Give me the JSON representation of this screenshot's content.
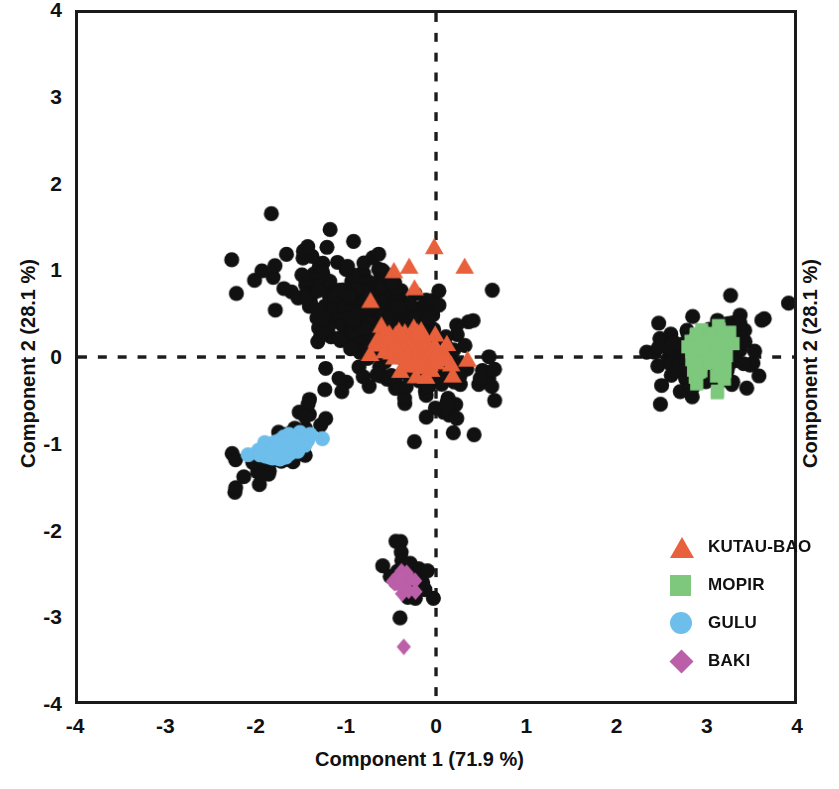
{
  "chart_data": {
    "type": "scatter",
    "title": "",
    "xlabel": "Component 1 (71.9 %)",
    "ylabel": "Component 2 (28.1 %)",
    "ylabel_right": "Component 2 (28.1 %)",
    "xlim": [
      -4,
      4
    ],
    "ylim": [
      -4,
      4
    ],
    "xticks": [
      "-4",
      "-3",
      "-2",
      "-1",
      "0",
      "1",
      "2",
      "3",
      "4"
    ],
    "yticks": [
      "4",
      "3",
      "2",
      "1",
      "0",
      "-1",
      "-2",
      "-3",
      "-4"
    ],
    "xtick_values": [
      -4,
      -3,
      -2,
      -1,
      0,
      1,
      2,
      3,
      4
    ],
    "ytick_values": [
      4,
      3,
      2,
      1,
      0,
      -1,
      -2,
      -3,
      -4
    ],
    "grid": false,
    "reference_lines": [
      {
        "axis": "x",
        "value": 0,
        "style": "dashed"
      },
      {
        "axis": "y",
        "value": 0,
        "style": "dashed"
      }
    ],
    "legend_position": "inside-lower-right",
    "series": [
      {
        "name": "UNASSIGNED",
        "marker": "circle",
        "color": "#111111",
        "in_legend": false,
        "clusters": [
          {
            "cx": -0.55,
            "cy": 0.3,
            "sx": 0.5,
            "sy": 0.4,
            "rho": -0.62,
            "n": 470
          },
          {
            "cx": 3.0,
            "cy": 0.05,
            "sx": 0.3,
            "sy": 0.22,
            "rho": 0.25,
            "n": 120
          },
          {
            "cx": -1.7,
            "cy": -1.05,
            "sx": 0.36,
            "sy": 0.32,
            "rho": 0.8,
            "n": 44
          },
          {
            "cx": -0.35,
            "cy": -2.58,
            "sx": 0.16,
            "sy": 0.17,
            "rho": 0.05,
            "n": 30
          }
        ]
      },
      {
        "name": "KUTAU-BAO",
        "marker": "triangle",
        "color": "#E8603C",
        "in_legend": true,
        "clusters": [
          {
            "cx": -0.3,
            "cy": 0.12,
            "sx": 0.22,
            "sy": 0.16,
            "rho": -0.55,
            "n": 110
          }
        ],
        "outliers": [
          {
            "x": -0.02,
            "y": 1.28
          },
          {
            "x": -0.3,
            "y": 1.05
          },
          {
            "x": -0.47,
            "y": 1.0
          },
          {
            "x": 0.32,
            "y": 1.05
          },
          {
            "x": -0.24,
            "y": 0.8
          }
        ]
      },
      {
        "name": "MOPIR",
        "marker": "square",
        "color": "#7DC87D",
        "in_legend": true,
        "clusters": [
          {
            "cx": 2.92,
            "cy": 0.02,
            "sx": 0.05,
            "sy": 0.16,
            "rho": 0.1,
            "n": 48
          },
          {
            "cx": 3.18,
            "cy": 0.06,
            "sx": 0.05,
            "sy": 0.17,
            "rho": 0.1,
            "n": 48
          }
        ]
      },
      {
        "name": "GULU",
        "marker": "circle",
        "color": "#6DBEEB",
        "in_legend": true,
        "clusters": [
          {
            "cx": -1.68,
            "cy": -1.04,
            "sx": 0.14,
            "sy": 0.07,
            "rho": 0.55,
            "n": 70
          }
        ]
      },
      {
        "name": "BAKI",
        "marker": "diamond",
        "color": "#BB5FA8",
        "in_legend": true,
        "clusters": [
          {
            "cx": -0.38,
            "cy": -2.62,
            "sx": 0.07,
            "sy": 0.06,
            "rho": 0.0,
            "n": 26
          }
        ],
        "outliers": [
          {
            "x": -0.36,
            "y": -3.37
          }
        ]
      }
    ],
    "legend": [
      {
        "label": "KUTAU-BAO",
        "marker": "triangle",
        "color": "#E8603C"
      },
      {
        "label": "MOPIR",
        "marker": "square",
        "color": "#7DC87D"
      },
      {
        "label": "GULU",
        "marker": "circle",
        "color": "#6DBEEB"
      },
      {
        "label": "BAKI",
        "marker": "diamond",
        "color": "#BB5FA8"
      }
    ]
  },
  "axes": {
    "x_title": "Component 1 (71.9 %)",
    "y_title_left": "Component 2 (28.1 %)",
    "y_title_right": "Component 2 (28.1 %)",
    "x_tick_labels": [
      "-4",
      "-3",
      "-2",
      "-1",
      "0",
      "1",
      "2",
      "3",
      "4"
    ],
    "y_tick_labels": [
      "4",
      "3",
      "2",
      "1",
      "0",
      "-1",
      "-2",
      "-3",
      "-4"
    ]
  },
  "legend": {
    "items": [
      {
        "label": "KUTAU-BAO"
      },
      {
        "label": "MOPIR"
      },
      {
        "label": "GULU"
      },
      {
        "label": "BAKI"
      }
    ]
  }
}
